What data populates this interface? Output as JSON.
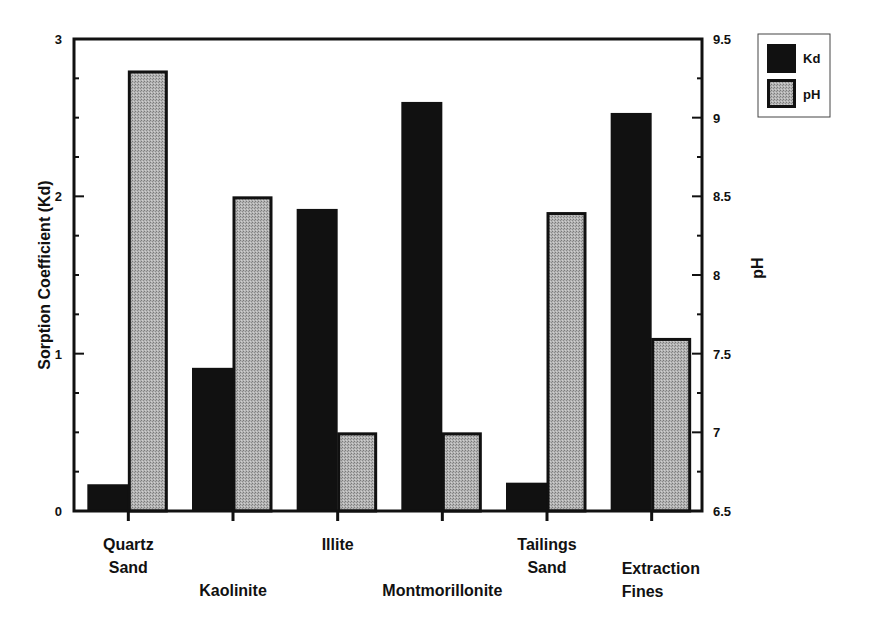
{
  "chart_data": {
    "type": "bar",
    "title": "",
    "categories": [
      [
        "Quartz",
        "Sand"
      ],
      [
        "Kaolinite"
      ],
      [
        "Illite"
      ],
      [
        "Montmorillonite"
      ],
      [
        "Tailings",
        "Sand"
      ],
      [
        "Extraction",
        "Fines"
      ]
    ],
    "category_label_rows": [
      0,
      1,
      0,
      1,
      0,
      1
    ],
    "series": [
      {
        "name": "Kd",
        "axis": "left",
        "color": "#111111",
        "values": [
          0.17,
          0.91,
          1.92,
          2.6,
          0.18,
          2.53
        ]
      },
      {
        "name": "pH",
        "axis": "right",
        "color": "#a9a9a9",
        "values": [
          9.3,
          8.5,
          7.0,
          7.0,
          8.4,
          7.6
        ]
      }
    ],
    "ylabel": "Sorption Coefficient (Kd)",
    "ylabel_right": "pH",
    "xlabel": "",
    "ylim": [
      0,
      3
    ],
    "ylim_right": [
      6.5,
      9.5
    ],
    "yticks": [
      "0",
      "1",
      "2",
      "3"
    ],
    "yticks_right": [
      "6.5",
      "7",
      "7.5",
      "8",
      "8.5",
      "9",
      "9.5"
    ],
    "grid": false,
    "legend_position": "top-right-outside"
  },
  "legend": {
    "items": [
      {
        "label": "Kd"
      },
      {
        "label": "pH"
      }
    ]
  }
}
